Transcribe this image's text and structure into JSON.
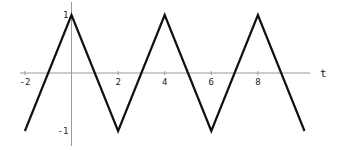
{
  "chart_data": {
    "type": "line",
    "title": "",
    "xlabel": "t",
    "ylabel": "",
    "xlim": [
      -2,
      10
    ],
    "ylim": [
      -1,
      1
    ],
    "grid": false,
    "legend": null,
    "x_ticks": [
      "-2",
      "2",
      "4",
      "6",
      "8"
    ],
    "y_ticks": [
      "1",
      "-1"
    ],
    "series": [
      {
        "name": "triangle wave",
        "x": [
          -2,
          0,
          2,
          4,
          6,
          8,
          10
        ],
        "y": [
          -1,
          1,
          -1,
          1,
          -1,
          1,
          -1
        ]
      }
    ],
    "colors": {
      "line": "#111111",
      "axis": "#999999"
    }
  }
}
